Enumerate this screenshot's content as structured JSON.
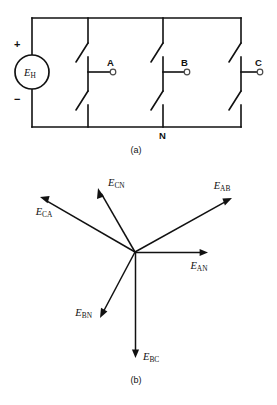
{
  "figure": {
    "type": "three-phase-source-circuit-and-phasor-diagram",
    "panels": [
      {
        "id": "a",
        "caption": "(a)",
        "caption_x": 136,
        "caption_y": 153
      },
      {
        "id": "b",
        "caption": "(b)",
        "caption_x": 136,
        "caption_y": 383
      }
    ]
  },
  "circuit": {
    "source": {
      "symbol_main": "E",
      "symbol_sub": "H",
      "plus_label": "+",
      "minus_label": "−",
      "cx": 32,
      "cy": 72,
      "r": 17,
      "plus_x": 18,
      "plus_y": 48,
      "minus_x": 18,
      "minus_y": 102
    },
    "rails": {
      "top_y": 18,
      "bottom_y": 127,
      "left_x": 32,
      "right_x": 241
    },
    "node_label": {
      "text": "N",
      "x": 163,
      "y": 139
    },
    "branches": [
      {
        "terminal": "A",
        "x": 88,
        "label_x": 107,
        "label_y": 66,
        "circle_x": 113,
        "circle_y": 72
      },
      {
        "terminal": "B",
        "x": 163,
        "label_x": 181,
        "label_y": 66,
        "circle_x": 187,
        "circle_y": 72
      },
      {
        "terminal": "C",
        "x": 241,
        "label_x": 255,
        "label_y": 66,
        "circle_x": 260,
        "circle_y": 72
      }
    ]
  },
  "chart_data": {
    "type": "scatter",
    "title": "",
    "xlabel": "",
    "ylabel": "",
    "origin": {
      "x": 135,
      "y": 252
    },
    "phasors": [
      {
        "name": "E_AN",
        "symbol_main": "E",
        "symbol_sub": "AN",
        "tip_x": 208,
        "tip_y": 253,
        "angle_deg": 0,
        "magnitude_px": 73,
        "label_x": 199,
        "label_y": 269,
        "label_anchor": "middle"
      },
      {
        "name": "E_BN",
        "symbol_main": "E",
        "symbol_sub": "BN",
        "tip_x": 100,
        "tip_y": 318,
        "angle_deg": -120,
        "magnitude_px": 75,
        "label_x": 92,
        "label_y": 316,
        "label_anchor": "end"
      },
      {
        "name": "E_CN",
        "symbol_main": "E",
        "symbol_sub": "CN",
        "tip_x": 98,
        "tip_y": 188,
        "angle_deg": 120,
        "magnitude_px": 72,
        "label_x": 108,
        "label_y": 186,
        "label_anchor": "start"
      },
      {
        "name": "E_AB",
        "symbol_main": "E",
        "symbol_sub": "AB",
        "tip_x": 232,
        "tip_y": 198,
        "angle_deg": 30,
        "magnitude_px": 112,
        "label_x": 222,
        "label_y": 189,
        "label_anchor": "middle"
      },
      {
        "name": "E_BC",
        "symbol_main": "E",
        "symbol_sub": "BC",
        "tip_x": 135,
        "tip_y": 358,
        "angle_deg": -90,
        "magnitude_px": 106,
        "label_x": 143,
        "label_y": 360,
        "label_anchor": "start"
      },
      {
        "name": "E_CA",
        "symbol_main": "E",
        "symbol_sub": "CA",
        "tip_x": 40,
        "tip_y": 197,
        "angle_deg": 150,
        "magnitude_px": 111,
        "label_x": 44,
        "label_y": 215,
        "label_anchor": "middle"
      }
    ]
  }
}
